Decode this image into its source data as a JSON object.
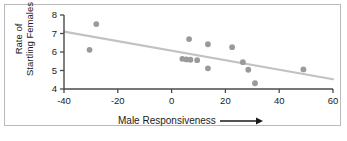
{
  "chart_data": {
    "type": "scatter",
    "title": "",
    "xlabel": "Male Responsiveness",
    "ylabel_line1": "Rate of",
    "ylabel_line2": "Startling Females",
    "xlabel_has_arrow": true,
    "xlim": [
      -40,
      60
    ],
    "ylim": [
      4,
      8
    ],
    "xticks": [
      -40,
      -20,
      0,
      20,
      40,
      60
    ],
    "xtick_labels": [
      "-40",
      "-20",
      "0",
      "20",
      "40",
      "60"
    ],
    "yticks": [
      4,
      5,
      6,
      7,
      8
    ],
    "ytick_labels": [
      "4",
      "5",
      "6",
      "7",
      "8"
    ],
    "grid": false,
    "legend": "none",
    "point_color": "#9a9a9a",
    "line_color": "#c2c2c2",
    "axis_color": "#4a4a4a",
    "frame_color": "#b9b9b9",
    "points": [
      {
        "x": -28.0,
        "y": 7.51
      },
      {
        "x": -30.5,
        "y": 6.12
      },
      {
        "x": 4.0,
        "y": 5.63
      },
      {
        "x": 5.5,
        "y": 5.6
      },
      {
        "x": 6.5,
        "y": 6.7
      },
      {
        "x": 7.0,
        "y": 5.58
      },
      {
        "x": 9.5,
        "y": 5.56
      },
      {
        "x": 13.5,
        "y": 6.42
      },
      {
        "x": 13.5,
        "y": 5.12
      },
      {
        "x": 22.5,
        "y": 6.26
      },
      {
        "x": 26.5,
        "y": 5.45
      },
      {
        "x": 28.5,
        "y": 5.04
      },
      {
        "x": 31.0,
        "y": 4.31
      },
      {
        "x": 49.0,
        "y": 5.06
      }
    ],
    "trendline": {
      "x_start": -40,
      "y_start": 7.1,
      "x_end": 60,
      "y_end": 4.53
    }
  }
}
